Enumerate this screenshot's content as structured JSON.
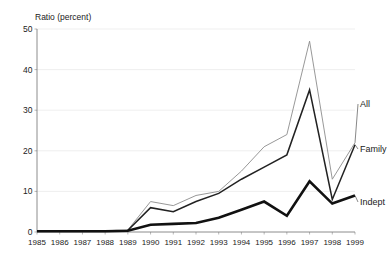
{
  "chart_data": {
    "type": "line",
    "title": "",
    "ylabel": "Ratio (percent)",
    "xlabel": "",
    "ylim": [
      0,
      50
    ],
    "yticks": [
      0,
      10,
      20,
      30,
      40,
      50
    ],
    "grid": true,
    "legend_position": "right-inline-labels",
    "categories": [
      "1985",
      "1986",
      "1987",
      "1988",
      "1989",
      "1990",
      "1991",
      "1992",
      "1993",
      "1994",
      "1995",
      "1996",
      "1997",
      "1998",
      "1999"
    ],
    "series": [
      {
        "name": "All",
        "style": "thin-light",
        "values": [
          0.3,
          0.3,
          0.3,
          0.3,
          0.5,
          7.5,
          6.5,
          9.0,
          10.0,
          15.0,
          21.0,
          24.0,
          47.0,
          13.0,
          22.0
        ]
      },
      {
        "name": "Family",
        "style": "medium-dark",
        "values": [
          0.3,
          0.3,
          0.3,
          0.3,
          0.4,
          6.0,
          5.0,
          7.5,
          9.5,
          13.0,
          16.0,
          19.0,
          35.0,
          8.0,
          21.5
        ]
      },
      {
        "name": "Indept",
        "style": "thick-dark",
        "values": [
          0.2,
          0.2,
          0.2,
          0.2,
          0.3,
          1.8,
          2.0,
          2.2,
          3.5,
          5.5,
          7.5,
          4.0,
          12.5,
          7.0,
          9.0
        ]
      }
    ],
    "series_labels": [
      {
        "text": "All",
        "value_year": "1999"
      },
      {
        "text": "Family",
        "value_year": "1999"
      },
      {
        "text": "Indept",
        "value_year": "1999"
      }
    ],
    "colors": {
      "all_line": "#8c8c8c",
      "family_line": "#222222",
      "indept_line": "#111111",
      "grid": "#e8e8e8",
      "axis": "#6f6f6f",
      "text": "#222222",
      "background": "#ffffff"
    }
  }
}
